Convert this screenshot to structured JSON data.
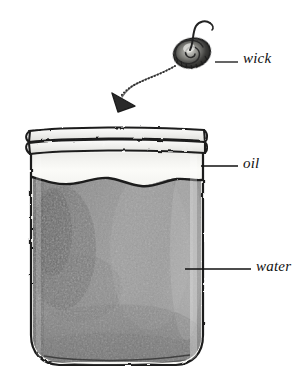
{
  "figure": {
    "background_color": "#ffffff",
    "ink_color": "#1a1a1a"
  },
  "labels": [
    {
      "id": "wick",
      "text": "wick",
      "leader_from_x": 215,
      "leader_to_x": 238,
      "leader_y": 62,
      "text_x": 243,
      "text_y": 50
    },
    {
      "id": "oil",
      "text": "oil",
      "leader_from_x": 201,
      "leader_to_x": 238,
      "leader_y": 166,
      "text_x": 243,
      "text_y": 155
    },
    {
      "id": "water",
      "text": "water",
      "leader_from_x": 185,
      "leader_to_x": 251,
      "leader_y": 269,
      "text_x": 256,
      "text_y": 258
    }
  ],
  "parts": {
    "wick_coil": {
      "name": "coiled wick",
      "center_x": 192,
      "center_y": 52,
      "radius_x": 18,
      "radius_y": 14,
      "fill": "#4a4a4a"
    },
    "arrow": {
      "name": "placement arrow",
      "from_x": 178,
      "from_y": 68,
      "to_x": 124,
      "to_y": 100,
      "style": "curved, head pointing down-left"
    },
    "jar": {
      "left": 30,
      "right": 204,
      "rim_top": 128,
      "rim_bottom": 152,
      "body_bottom": 366,
      "glass_fill": "#f2f2f0"
    },
    "oil_layer": {
      "top": 153,
      "bottom": 184,
      "fill": "#f7f7f4",
      "boundary": "wavy meniscus"
    },
    "water_layer": {
      "top": 178,
      "bottom": 360,
      "fill": "#8f8f8f",
      "shadow_fill": "#6a6a6a"
    }
  }
}
